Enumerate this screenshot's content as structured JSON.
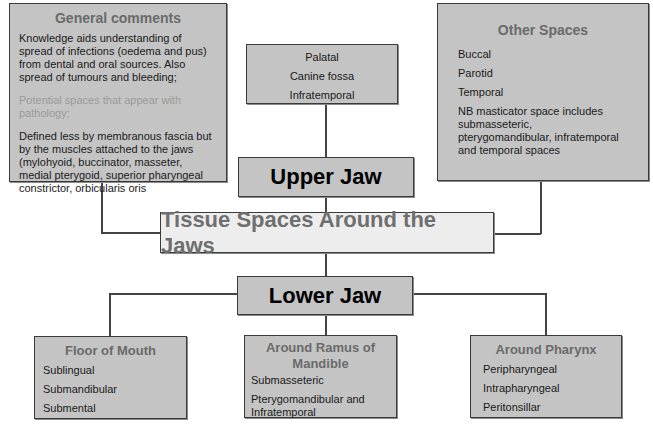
{
  "title": "Tissue Spaces Around the Jaws",
  "general_comments": {
    "heading": "General comments",
    "para1": "Knowledge aids understanding of spread of infections (oedema and pus) from dental and oral sources. Also spread of tumours and bleeding;",
    "para2": "Potential spaces that appear with pathology;",
    "para3": "Defined less by membranous fascia but by the muscles attached to the jaws (mylohyoid, buccinator, masseter, medial pterygoid, superior pharyngeal constrictor, orbicularis oris"
  },
  "upper_jaw": {
    "label": "Upper Jaw",
    "spaces": [
      "Palatal",
      "Canine fossa",
      "Infratemporal"
    ]
  },
  "other_spaces": {
    "heading": "Other Spaces",
    "items": [
      "Buccal",
      "Parotid",
      "Temporal",
      "NB masticator space includes submasseteric, pterygomandibular, infratemporal and temporal spaces"
    ]
  },
  "lower_jaw": {
    "label": "Lower Jaw",
    "groups": [
      {
        "heading": "Floor of Mouth",
        "items": [
          "Sublingual",
          "Submandibular",
          "Submental"
        ]
      },
      {
        "heading": "Around Ramus of Mandible",
        "items": [
          "Submasseteric",
          "Pterygomandibular and Infratemporal"
        ]
      },
      {
        "heading": "Around Pharynx",
        "items": [
          "Peripharyngeal",
          "Intrapharyngeal",
          "Peritonsillar"
        ]
      }
    ]
  }
}
